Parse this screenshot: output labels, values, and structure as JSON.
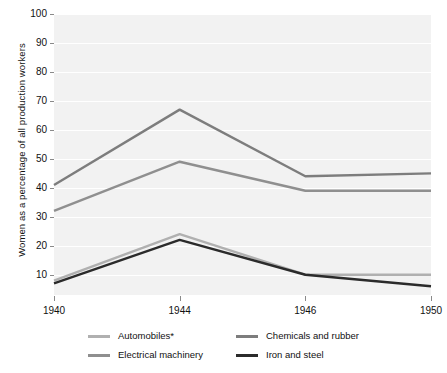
{
  "chart_data": {
    "type": "line",
    "title": "",
    "xlabel": "",
    "ylabel": "Women as a percentage of all production workers",
    "categories": [
      "1940",
      "1944",
      "1946",
      "1950"
    ],
    "x_tick_labels": [
      "1940",
      "1944",
      "1946",
      "1950"
    ],
    "y_tick_labels": [
      "10",
      "20",
      "30",
      "40",
      "50",
      "60",
      "70",
      "80",
      "90",
      "100"
    ],
    "y_ticks": [
      10,
      20,
      30,
      40,
      50,
      60,
      70,
      80,
      90,
      100
    ],
    "ylim": [
      3,
      100
    ],
    "grid": "horizontal",
    "legend_position": "bottom",
    "plot_background": "#f2f2f2",
    "gridline_color": "#ffffff",
    "series": [
      {
        "name": "Automobiles*",
        "color": "#b0b0b0",
        "values": [
          8,
          24,
          10,
          10
        ]
      },
      {
        "name": "Chemicals and rubber",
        "color": "#7d7d7d",
        "values": [
          41,
          67,
          44,
          45
        ]
      },
      {
        "name": "Electrical machinery",
        "color": "#8f8f8f",
        "values": [
          32,
          49,
          39,
          39
        ]
      },
      {
        "name": "Iron and steel",
        "color": "#2b2b2b",
        "values": [
          7,
          22,
          10,
          6
        ]
      }
    ],
    "legend_entries": [
      {
        "label": "Automobiles*",
        "color": "#b0b0b0"
      },
      {
        "label": "Chemicals and rubber",
        "color": "#7d7d7d"
      },
      {
        "label": "Electrical machinery",
        "color": "#8f8f8f"
      },
      {
        "label": "Iron and steel",
        "color": "#2b2b2b"
      }
    ]
  }
}
